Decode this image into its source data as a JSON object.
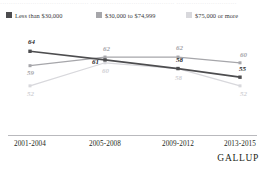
{
  "top_sliver": {
    "text": "·········································  ·······································   ····························"
  },
  "legend": {
    "items": [
      {
        "label": "Less than $30,000",
        "color": "#4d4d4f",
        "swatch_name": "legend-swatch-low-income"
      },
      {
        "label": "$30,000 to $74,999",
        "color": "#a6a6aa",
        "swatch_name": "legend-swatch-mid-income"
      },
      {
        "label": "$75,000 or more",
        "color": "#d8d8dc",
        "swatch_name": "legend-swatch-high-income"
      }
    ]
  },
  "brand": {
    "name": "GALLUP"
  },
  "chart_data": {
    "type": "line",
    "title": "",
    "subtitle": "",
    "xlabel": "",
    "ylabel": "",
    "categories": [
      "2001-2004",
      "2005-2008",
      "2009-2012",
      "2013-2015"
    ],
    "ylim": [
      45,
      70
    ],
    "grid": false,
    "legend_position": "top",
    "series": [
      {
        "name": "Less than $30,000",
        "color": "#4d4d4f",
        "values": [
          64,
          61,
          58,
          55
        ],
        "labels": [
          "64",
          "61",
          "58",
          "55"
        ]
      },
      {
        "name": "$30,000 to $74,999",
        "color": "#a6a6aa",
        "values": [
          59,
          62,
          62,
          60
        ],
        "labels": [
          "59",
          "62",
          "62",
          "60"
        ]
      },
      {
        "name": "$75,000 or more",
        "color": "#d8d8dc",
        "values": [
          52,
          60,
          58,
          52
        ],
        "labels": [
          "52",
          "60",
          "58",
          "52"
        ]
      }
    ]
  }
}
